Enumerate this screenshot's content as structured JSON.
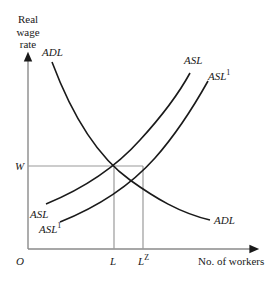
{
  "diagram": {
    "y_axis_label": [
      "Real",
      "wage",
      "rate"
    ],
    "x_axis_label": "No. of workers",
    "origin_label": "O",
    "wage_label": "W",
    "x_ticks": [
      {
        "label": "L",
        "sup": ""
      },
      {
        "label": "L",
        "sup": "Z"
      }
    ],
    "curves": [
      {
        "name": "ADL",
        "label_top": "ADL",
        "label_bottom": "ADL",
        "type": "demand"
      },
      {
        "name": "ASL",
        "label_top": "ASL",
        "label_bottom": "ASL",
        "type": "supply"
      },
      {
        "name": "ASL1",
        "label_top": "ASL",
        "label_bottom": "ASL",
        "sup": "1",
        "type": "supply-shifted"
      }
    ],
    "colors": {
      "curve": "#1a1a1a",
      "axis": "#8a8a8a",
      "guide": "#9a9a9a"
    }
  }
}
